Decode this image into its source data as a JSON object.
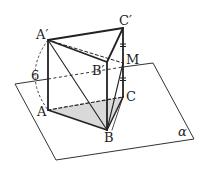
{
  "diagram": {
    "type": "triangular prism on plane",
    "colors": {
      "line": "#222222",
      "plane": "#333333",
      "shade": "#d9d9d9"
    },
    "labels": {
      "A_prime": "A′",
      "B_prime": "B′",
      "C_prime": "C′",
      "A": "A",
      "B": "B",
      "C": "C",
      "M": "M",
      "length": "6",
      "plane": "α"
    }
  }
}
